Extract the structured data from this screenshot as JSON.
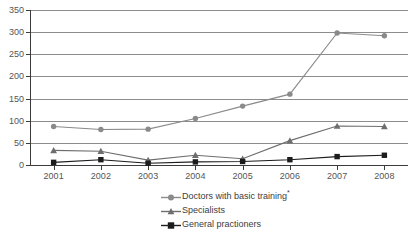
{
  "chart_data": {
    "type": "line",
    "title": "",
    "xlabel": "",
    "ylabel": "",
    "categories": [
      "2001",
      "2002",
      "2003",
      "2004",
      "2005",
      "2006",
      "2007",
      "2008"
    ],
    "ylim": [
      0,
      350
    ],
    "y_ticks": [
      0,
      50,
      100,
      150,
      200,
      250,
      300,
      350
    ],
    "y_tick_labels": [
      "0",
      "50",
      "100",
      "150",
      "200",
      "250",
      "300",
      "350"
    ],
    "grid": true,
    "legend_position": "bottom-center",
    "series": [
      {
        "name": "Doctors with basic training*",
        "marker": "circle",
        "color": "#8a8a8a",
        "values": [
          87,
          80,
          81,
          105,
          133,
          160,
          298,
          292
        ]
      },
      {
        "name": "Specialists",
        "marker": "triangle",
        "color": "#6e6e6e",
        "values": [
          33,
          31,
          11,
          22,
          14,
          55,
          88,
          87
        ]
      },
      {
        "name": "General practioners",
        "marker": "square",
        "color": "#1c1c1c",
        "values": [
          6,
          12,
          4,
          7,
          8,
          12,
          19,
          22
        ]
      }
    ]
  },
  "legend": {
    "items": [
      {
        "label": "Doctors with basic training",
        "superscript": "*"
      },
      {
        "label": "Specialists",
        "superscript": ""
      },
      {
        "label": "General practioners",
        "superscript": ""
      }
    ]
  }
}
